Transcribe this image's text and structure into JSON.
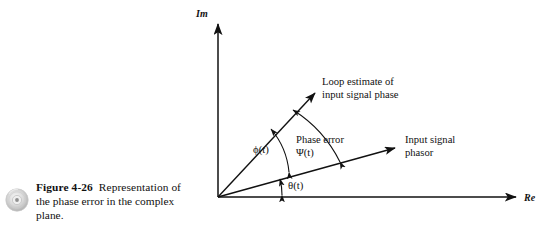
{
  "figure": {
    "number_label": "Figure 4-26",
    "caption_line1": "Representation",
    "caption_line2": "of the phase error in the",
    "caption_line3": "complex plane.",
    "caption_full": "Figure 4-26  Representation of the phase error in the complex plane.",
    "media_icon": "compact-disc-icon"
  },
  "diagram": {
    "type": "phasor-vector-diagram",
    "axes": {
      "imaginary_label": "Im",
      "real_label": "Re",
      "origin_px": [
        218,
        197
      ],
      "im_axis_top_px": [
        218,
        22
      ],
      "re_axis_right_px": [
        518,
        197
      ]
    },
    "vectors": [
      {
        "name": "loop-estimate-vector",
        "label_line1": "Loop estimate of",
        "label_line2": "input signal phase",
        "from_px": [
          218,
          197
        ],
        "to_px": [
          318,
          90
        ],
        "angle_deg": 47
      },
      {
        "name": "input-signal-phasor-vector",
        "label_line1": "Input signal",
        "label_line2": "phasor",
        "from_px": [
          218,
          197
        ],
        "to_px": [
          398,
          147
        ],
        "angle_deg": 15.5
      }
    ],
    "angles": [
      {
        "name": "phi-angle",
        "label": "ϕ(t)",
        "description": "loop estimate phase angle from real axis"
      },
      {
        "name": "theta-angle",
        "label": "θ(t)",
        "description": "input signal phase angle from real axis"
      },
      {
        "name": "psi-angle",
        "label_line1": "Phase error",
        "label_line2": "Ψ(t)",
        "description": "phase error between loop estimate and input signal phasor"
      }
    ],
    "colors": {
      "ink": "#111111",
      "background": "#ffffff",
      "disc_gray": "#b9b9b9"
    }
  }
}
